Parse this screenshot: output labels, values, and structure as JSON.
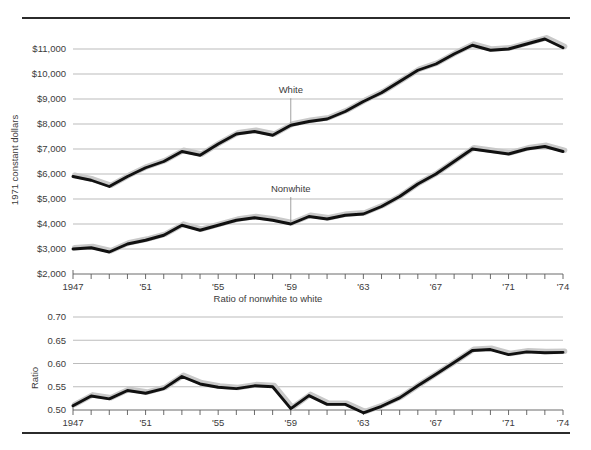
{
  "figure": {
    "top_rule": "",
    "bottom_rule": ""
  },
  "chart_data": [
    {
      "type": "line",
      "id": "income",
      "title": "",
      "xlabel": "",
      "ylabel": "1971 constant dollars",
      "ylim": [
        2000,
        11000
      ],
      "yticks": [
        2000,
        3000,
        4000,
        5000,
        6000,
        7000,
        8000,
        9000,
        10000,
        11000
      ],
      "ytick_labels": [
        "$2,000",
        "$3,000",
        "$4,000",
        "$5,000",
        "$6,000",
        "$7,000",
        "$8,000",
        "$9,000",
        "$10,000",
        "$11,000"
      ],
      "grid": true,
      "legend_position": "inline-annotation",
      "x": [
        1947,
        1948,
        1949,
        1950,
        1951,
        1952,
        1953,
        1954,
        1955,
        1956,
        1957,
        1958,
        1959,
        1960,
        1961,
        1962,
        1963,
        1964,
        1965,
        1966,
        1967,
        1968,
        1969,
        1970,
        1971,
        1972,
        1973,
        1974
      ],
      "xticks": [
        1947,
        1948,
        1949,
        1950,
        1951,
        1952,
        1953,
        1954,
        1955,
        1956,
        1957,
        1958,
        1959,
        1960,
        1961,
        1962,
        1963,
        1964,
        1965,
        1966,
        1967,
        1968,
        1969,
        1970,
        1971,
        1972,
        1973,
        1974
      ],
      "xtick_labels": [
        "1947",
        "",
        "",
        "",
        "'51",
        "",
        "",
        "",
        "'55",
        "",
        "",
        "",
        "'59",
        "",
        "",
        "",
        "'63",
        "",
        "",
        "",
        "'67",
        "",
        "",
        "",
        "'71",
        "",
        "",
        "'74"
      ],
      "series": [
        {
          "name": "White",
          "annotation": "White",
          "annotation_x": 1959,
          "values": [
            5900,
            5750,
            5500,
            5900,
            6250,
            6500,
            6900,
            6750,
            7200,
            7600,
            7700,
            7550,
            7950,
            8100,
            8200,
            8500,
            8900,
            9250,
            9700,
            10150,
            10400,
            10800,
            11150,
            10950,
            11000,
            11200,
            11400,
            11050
          ]
        },
        {
          "name": "Nonwhite",
          "annotation": "Nonwhite",
          "annotation_x": 1959,
          "values": [
            3000,
            3050,
            2880,
            3200,
            3350,
            3550,
            3950,
            3750,
            3950,
            4150,
            4250,
            4150,
            4000,
            4300,
            4200,
            4350,
            4400,
            4700,
            5100,
            5600,
            6000,
            6500,
            7000,
            6900,
            6800,
            7000,
            7100,
            6900
          ]
        }
      ]
    },
    {
      "type": "line",
      "id": "ratio",
      "title": "Ratio of nonwhite to white",
      "xlabel": "",
      "ylabel": "Ratio",
      "ylim": [
        0.5,
        0.7
      ],
      "yticks": [
        0.5,
        0.55,
        0.6,
        0.65,
        0.7
      ],
      "ytick_labels": [
        "0.50",
        "0.55",
        "0.60",
        "0.65",
        "0.70"
      ],
      "grid": true,
      "legend_position": "none",
      "x": [
        1947,
        1948,
        1949,
        1950,
        1951,
        1952,
        1953,
        1954,
        1955,
        1956,
        1957,
        1958,
        1959,
        1960,
        1961,
        1962,
        1963,
        1964,
        1965,
        1966,
        1967,
        1968,
        1969,
        1970,
        1971,
        1972,
        1973,
        1974
      ],
      "xticks": [
        1947,
        1948,
        1949,
        1950,
        1951,
        1952,
        1953,
        1954,
        1955,
        1956,
        1957,
        1958,
        1959,
        1960,
        1961,
        1962,
        1963,
        1964,
        1965,
        1966,
        1967,
        1968,
        1969,
        1970,
        1971,
        1972,
        1973,
        1974
      ],
      "xtick_labels": [
        "1947",
        "",
        "",
        "",
        "'51",
        "",
        "",
        "",
        "'55",
        "",
        "",
        "",
        "'59",
        "",
        "",
        "",
        "'63",
        "",
        "",
        "",
        "'67",
        "",
        "",
        "",
        "'71",
        "",
        "",
        "'74"
      ],
      "series": [
        {
          "name": "Ratio of nonwhite to white",
          "values": [
            0.509,
            0.53,
            0.524,
            0.542,
            0.536,
            0.546,
            0.572,
            0.556,
            0.549,
            0.546,
            0.552,
            0.55,
            0.503,
            0.531,
            0.512,
            0.512,
            0.494,
            0.508,
            0.526,
            0.552,
            0.577,
            0.602,
            0.628,
            0.63,
            0.619,
            0.625,
            0.623,
            0.624
          ]
        }
      ]
    }
  ],
  "labels": {
    "income_ylabel": "1971 constant dollars",
    "ratio_ylabel": "Ratio",
    "ratio_title": "Ratio of nonwhite to white",
    "white_annotation": "White",
    "nonwhite_annotation": "Nonwhite"
  },
  "colors": {
    "line": "#111111",
    "shadow": "#c9c9c9",
    "grid": "#8f8f8f",
    "text": "#3c3b3b",
    "rule": "#2b2b2b"
  }
}
